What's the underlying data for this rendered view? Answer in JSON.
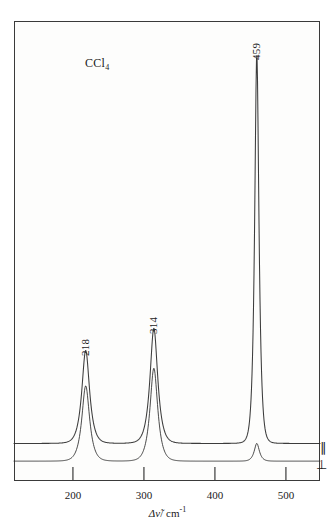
{
  "figure": {
    "sample_label": "CCl",
    "sample_subscript": "4",
    "background_color": "#ffffff",
    "trace_color": "#2b2b2b",
    "frame_color": "#3a3a3a"
  },
  "axis": {
    "x_title_delta": "Δ",
    "x_title_nu": "ν̃",
    "x_title_unit": "/ cm",
    "x_title_exponent": "-1",
    "x_ticks": [
      200,
      300,
      400,
      500
    ],
    "x_tick_labels": [
      "200",
      "300",
      "400",
      "500"
    ],
    "x_min": 117,
    "x_max": 548,
    "y_label": ""
  },
  "polarization": {
    "parallel_symbol": "∥",
    "perpendicular_symbol": "⊥"
  },
  "peak_labels": [
    {
      "text": "218",
      "x": 218
    },
    {
      "text": "314",
      "x": 314
    },
    {
      "text": "459",
      "x": 459
    }
  ],
  "chart_data": {
    "type": "line",
    "title": "",
    "subtitle": "",
    "annotations": [
      "CCl4",
      "218",
      "314",
      "459",
      "∥",
      "⊥"
    ],
    "xlabel": "Δν̃ / cm-1",
    "ylabel": "Scattered intensity",
    "xlim": [
      117,
      548
    ],
    "ylim": [
      0,
      100
    ],
    "grid": false,
    "legend_position": "right-inside",
    "x_tick_labels": [
      "200",
      "300",
      "400",
      "500"
    ],
    "series": [
      {
        "name": "∥ (parallel polarization)",
        "baseline": 6,
        "peaks": [
          {
            "center": 218,
            "height": 21,
            "width": 9
          },
          {
            "center": 314,
            "height": 26,
            "width": 9
          },
          {
            "center": 459,
            "height": 88,
            "width": 5
          }
        ]
      },
      {
        "name": "⊥ (perpendicular polarization)",
        "baseline": 2,
        "peaks": [
          {
            "center": 218,
            "height": 17,
            "width": 9
          },
          {
            "center": 314,
            "height": 21,
            "width": 9
          },
          {
            "center": 459,
            "height": 4,
            "width": 6
          }
        ]
      }
    ]
  }
}
